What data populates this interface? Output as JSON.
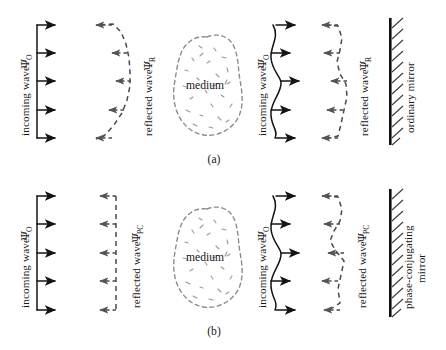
{
  "figure": {
    "background_color": "#ffffff",
    "ink_color": "#141414",
    "dashed_color": "#4a4a4a",
    "blob_color": "#8c8c8c",
    "width": 446,
    "height": 350
  },
  "panels": [
    {
      "id": "a",
      "caption": "(a)",
      "mirror_label": "ordinary mirror",
      "medium_label": "medium",
      "groups": [
        {
          "id": "a-left-incoming",
          "label_text": "incoming wave",
          "symbol": "Ψ",
          "subscript": "O",
          "wavefront": "flat",
          "direction": "right",
          "ray_count": 5
        },
        {
          "id": "a-left-reflected",
          "label_text": "reflected wave",
          "symbol": "Ψ",
          "subscript": "R",
          "wavefront": "distorted-bulge-left",
          "direction": "left",
          "ray_count": 5
        },
        {
          "id": "a-right-incoming",
          "label_text": "incoming wave",
          "symbol": "Ψ",
          "subscript": "O",
          "wavefront": "distorted-s-curve",
          "direction": "right",
          "ray_count": 5
        },
        {
          "id": "a-right-reflected",
          "label_text": "reflected wave",
          "symbol": "Ψ",
          "subscript": "R",
          "wavefront": "distorted-mirrored",
          "direction": "left",
          "ray_count": 5
        }
      ]
    },
    {
      "id": "b",
      "caption": "(b)",
      "mirror_label": "phase-conjugating",
      "mirror_label_line2": "mirror",
      "medium_label": "medium",
      "groups": [
        {
          "id": "b-left-incoming",
          "label_text": "incoming wave",
          "symbol": "Ψ",
          "subscript": "O",
          "wavefront": "flat",
          "direction": "right",
          "ray_count": 5
        },
        {
          "id": "b-left-reflected",
          "label_text": "reflected wave",
          "symbol": "Ψ",
          "subscript": "PC",
          "wavefront": "flat",
          "direction": "left",
          "ray_count": 5
        },
        {
          "id": "b-right-incoming",
          "label_text": "incoming wave",
          "symbol": "Ψ",
          "subscript": "O",
          "wavefront": "distorted-s-curve",
          "direction": "right",
          "ray_count": 5
        },
        {
          "id": "b-right-reflected",
          "label_text": "reflected wave",
          "symbol": "Ψ",
          "subscript": "PC",
          "wavefront": "distorted-conjugate",
          "direction": "left",
          "ray_count": 5
        }
      ]
    }
  ]
}
